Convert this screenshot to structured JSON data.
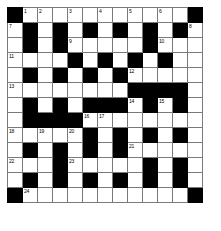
{
  "puzzle": {
    "type": "crossword-grid",
    "rows": 13,
    "cols": 13,
    "cell_size_px": 16,
    "colors": {
      "block": "#000000",
      "cell": "#ffffff",
      "grid_line": "#7a7a7a",
      "number": "#000000"
    },
    "grid": [
      [
        "block",
        "1",
        "",
        "",
        "3",
        "",
        "4",
        "",
        "5",
        "",
        "6",
        "",
        "block"
      ],
      [
        "7",
        "block",
        "",
        "block",
        "",
        "block",
        "",
        "block",
        "",
        "block",
        "",
        "block",
        "8"
      ],
      [
        "",
        "block",
        "",
        "block",
        "9",
        "",
        "",
        "",
        "",
        "block",
        "10",
        "",
        ""
      ],
      [
        "11",
        "",
        "",
        "",
        "block",
        "",
        "block",
        "",
        "block",
        "",
        "block",
        "",
        ""
      ],
      [
        "",
        "block",
        "",
        "block",
        "",
        "block",
        "",
        "block",
        "12",
        "",
        "",
        "",
        ""
      ],
      [
        "13",
        "",
        "",
        "",
        "",
        "",
        "",
        "",
        "block",
        "block",
        "block",
        "block",
        ""
      ],
      [
        "",
        "block",
        "",
        "block",
        "",
        "block",
        "block",
        "block",
        "14",
        "block",
        "15",
        "block",
        ""
      ],
      [
        "",
        "block",
        "block",
        "block",
        "block",
        "16",
        "17",
        "",
        "",
        "",
        "",
        "",
        ""
      ],
      [
        "18",
        "",
        "19",
        "",
        "20",
        "block",
        "",
        "block",
        "",
        "block",
        "",
        "block",
        ""
      ],
      [
        "",
        "block",
        "",
        "block",
        "",
        "block",
        "",
        "block",
        "21",
        "",
        "",
        "",
        ""
      ],
      [
        "22",
        "",
        "",
        "block",
        "23",
        "",
        "",
        "",
        "",
        "block",
        "",
        "block",
        ""
      ],
      [
        "",
        "block",
        "",
        "block",
        "",
        "block",
        "",
        "block",
        "",
        "block",
        "",
        "block",
        ""
      ],
      [
        "block",
        "24",
        "",
        "",
        "",
        "",
        "",
        "",
        "",
        "",
        "",
        "",
        "block"
      ]
    ],
    "numbers_visible": [
      "1",
      "2",
      "3",
      "4",
      "5",
      "6",
      "7",
      "8",
      "9",
      "10",
      "11",
      "12",
      "13",
      "14",
      "15",
      "16",
      "17",
      "18",
      "19",
      "20",
      "21",
      "22",
      "23",
      "24"
    ],
    "row_1_extra": {
      "col_3_number": "2"
    }
  }
}
